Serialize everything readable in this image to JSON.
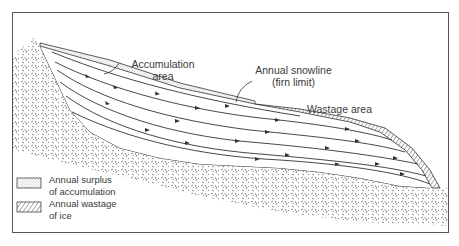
{
  "figure": {
    "type": "glacier-cross-section",
    "labels": {
      "accumulation_line1": "Accumulation",
      "accumulation_line2": "area",
      "snowline_line1": "Annual snowline",
      "snowline_line2": "(firn limit)",
      "wastage": "Wastage area"
    },
    "legend": {
      "items": [
        {
          "pattern": "stippled",
          "line1": "Annual surplus",
          "line2": "of accumulation"
        },
        {
          "pattern": "hatched",
          "line1": "Annual wastage",
          "line2": "of ice"
        }
      ]
    },
    "colors": {
      "ink": "#3a3a3a",
      "frame": "#555555",
      "background": "#ffffff"
    }
  }
}
